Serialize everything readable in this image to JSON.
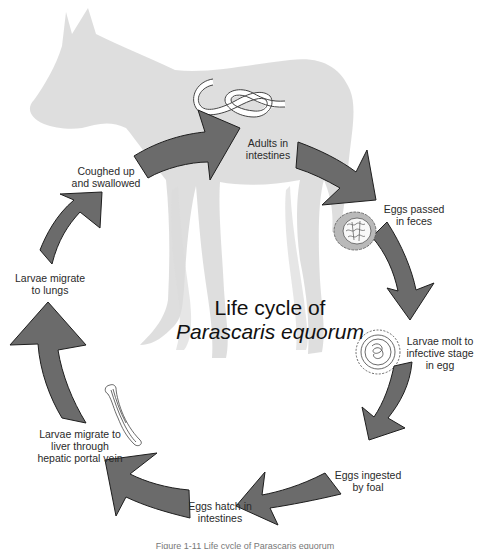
{
  "diagram": {
    "title_line1": "Life cycle of",
    "title_line2": "Parascaris equorum",
    "caption": "Figure 1-11  Life cycle of Parascaris equorum",
    "colors": {
      "arrow_fill": "#6b6b6b",
      "arrow_stroke": "#1e1e1e",
      "horse_silhouette": "#dcdcdc",
      "egg_shell": "#b9b9b9",
      "text": "#2a2a2a"
    },
    "stages": [
      {
        "id": "adults",
        "label": "Adults in\nintestines"
      },
      {
        "id": "eggs-passed",
        "label": "Eggs passed\nin feces"
      },
      {
        "id": "larvae-molt",
        "label": "Larvae molt to\ninfective stage\nin egg"
      },
      {
        "id": "eggs-ingested",
        "label": "Eggs ingested\nby foal"
      },
      {
        "id": "eggs-hatch",
        "label": "Eggs hatch in\nintestines"
      },
      {
        "id": "larvae-liver",
        "label": "Larvae migrate to\nliver through\nhepatic portal vein"
      },
      {
        "id": "larvae-lungs",
        "label": "Larvae migrate\nto lungs"
      },
      {
        "id": "coughed",
        "label": "Coughed up\nand swallowed"
      }
    ],
    "icons": [
      "horse-silhouette",
      "adult-worm-icon",
      "fertile-egg-icon",
      "embryonated-egg-icon",
      "larva-icon",
      "cycle-arrow"
    ]
  }
}
